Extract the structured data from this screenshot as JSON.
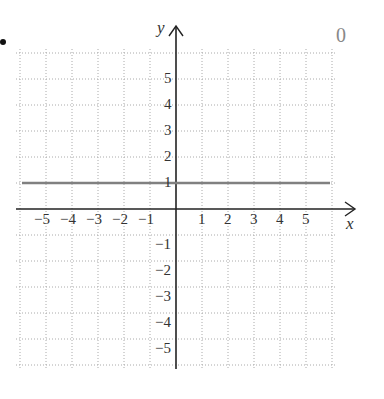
{
  "problem": {
    "bullet": "•",
    "answer_label": "0"
  },
  "chart_data": {
    "type": "line",
    "title": "",
    "xlabel": "x",
    "ylabel": "y",
    "xlim": [
      -6,
      6
    ],
    "ylim": [
      -6,
      6
    ],
    "grid": true,
    "grid_style": "dotted",
    "x_ticks": [
      -5,
      -4,
      -3,
      -2,
      -1,
      1,
      2,
      3,
      4,
      5
    ],
    "y_ticks": [
      5,
      4,
      3,
      2,
      1,
      -1,
      -2,
      -3,
      -4,
      -5
    ],
    "x_tick_labels": [
      "−5",
      "−4",
      "−3",
      "−2",
      "−1",
      "1",
      "2",
      "3",
      "4",
      "5"
    ],
    "y_tick_labels": [
      "5",
      "4",
      "3",
      "2",
      "1",
      "−1",
      "−2",
      "−3",
      "−4",
      "−5"
    ],
    "series": [
      {
        "name": "y = 1",
        "x": [
          -6,
          6
        ],
        "y": [
          1,
          1
        ],
        "color": "#808080"
      }
    ],
    "legend": null
  }
}
